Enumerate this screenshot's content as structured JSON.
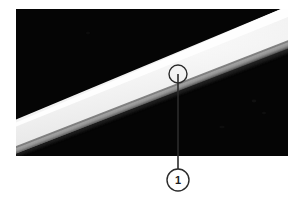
{
  "figure": {
    "kind": "annotated-photograph",
    "background_color": "#ffffff",
    "photo": {
      "x": 16,
      "y": 9,
      "width": 272,
      "height": 147,
      "background_color": "#050505",
      "subject_description": "bright white diagonal band on black background",
      "band": {
        "highlight_color": "#ffffff",
        "body_color": "#f2f2f2",
        "shadow_edge_color": "#8e8e8e",
        "orientation": "lower-left to upper-right"
      }
    },
    "annotation": {
      "marker_circle": {
        "center_x": 178,
        "center_y": 74,
        "radius": 9,
        "stroke_color": "#2b2b2b"
      },
      "leader_line": {
        "from_x": 178,
        "from_y": 74,
        "to_x": 178,
        "to_y": 169,
        "stroke_color": "#2b2b2b"
      },
      "callout": {
        "label": "1",
        "center_x": 178,
        "center_y": 180,
        "radius": 11,
        "stroke_color": "#2b2b2b",
        "fill_color": "#ffffff",
        "text_color": "#1c1c1c"
      }
    }
  }
}
